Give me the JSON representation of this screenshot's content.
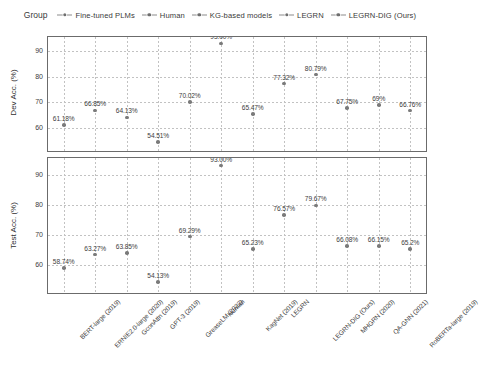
{
  "legend": {
    "title": "Group",
    "entries": [
      {
        "label": "Fine-tuned PLMs",
        "color": "#7a7a7a"
      },
      {
        "label": "Human",
        "color": "#7a7a7a"
      },
      {
        "label": "KG-based models",
        "color": "#7a7a7a"
      },
      {
        "label": "LEGRN",
        "color": "#7a7a7a"
      },
      {
        "label": "LEGRN-DIG (Ours)",
        "color": "#7a7a7a"
      }
    ]
  },
  "chart_data": {
    "type": "scatter",
    "title": "",
    "xlabel": "",
    "grid": true,
    "legend_position": "top",
    "categories": [
      "BERT-large (2019)",
      "ERNIE2.0-large (2020)",
      "GconAttn (2019)",
      "GPT-3 (2019)",
      "GreaseLM (2022)",
      "Human",
      "KagNet (2019)",
      "LEGRN",
      "LEGRN-DIG (Ours)",
      "MHGRN (2020)",
      "QA-GNN (2021)",
      "RoBERTa-large (2019)"
    ],
    "groups": [
      "Fine-tuned PLMs",
      "Fine-tuned PLMs",
      "KG-based models",
      "Fine-tuned PLMs",
      "KG-based models",
      "Human",
      "KG-based models",
      "LEGRN",
      "LEGRN-DIG (Ours)",
      "KG-based models",
      "KG-based models",
      "Fine-tuned PLMs"
    ],
    "panels": [
      {
        "ylabel": "Dev Acc. (%)",
        "yticks": [
          60,
          70,
          80,
          90
        ],
        "ylim": [
          51.0,
          95.5
        ],
        "values": [
          61.18,
          66.85,
          64.13,
          54.51,
          70.02,
          93.0,
          65.47,
          77.32,
          80.79,
          67.75,
          69.0,
          66.76
        ],
        "labels": [
          "61.18%",
          "66.85%",
          "64.13%",
          "54.51%",
          "70.02%",
          "93.00%",
          "65.47%",
          "77.32%",
          "80.79%",
          "67.75%",
          "69%",
          "66.76%"
        ]
      },
      {
        "ylabel": "Test Acc. (%)",
        "yticks": [
          60,
          70,
          80,
          90
        ],
        "ylim": [
          50.5,
          95.5
        ],
        "values": [
          58.74,
          63.27,
          63.85,
          54.13,
          69.29,
          93.0,
          65.23,
          76.57,
          79.67,
          66.08,
          66.15,
          65.2
        ],
        "labels": [
          "58.74%",
          "63.27%",
          "63.85%",
          "54.13%",
          "69.29%",
          "93.00%",
          "65.23%",
          "76.57%",
          "79.67%",
          "66.08%",
          "66.15%",
          "65.2%"
        ]
      }
    ]
  }
}
